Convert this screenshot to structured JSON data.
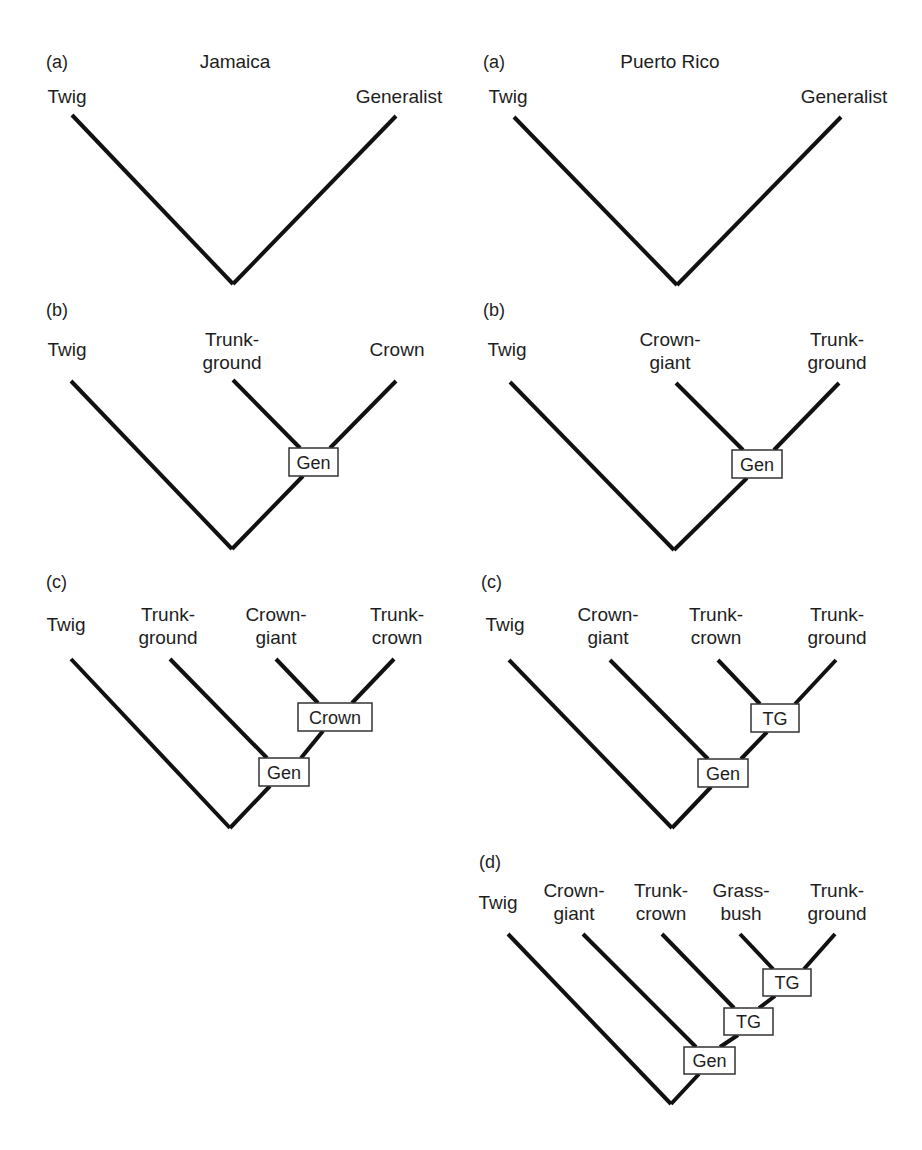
{
  "figure": {
    "columns": [
      {
        "title": "Jamaica",
        "title_pos": [
          235,
          68
        ]
      },
      {
        "title": "Puerto Rico",
        "title_pos": [
          670,
          68
        ]
      }
    ],
    "colors": {
      "line": "#111111",
      "text": "#1e1e1e",
      "box_border": "#333333",
      "background": "#ffffff"
    }
  },
  "trees": [
    {
      "id": "jamaica-a",
      "island": "Jamaica",
      "panel": "(a)",
      "panel_pos": [
        46,
        68
      ],
      "tips": [
        {
          "lines": [
            "Twig"
          ],
          "x": 67,
          "y": 103,
          "anchor": "middle"
        },
        {
          "lines": [
            "Generalist"
          ],
          "x": 399,
          "y": 103,
          "anchor": "middle"
        }
      ],
      "segments": [
        [
          72,
          115,
          233,
          284
        ],
        [
          396,
          116,
          233,
          284
        ]
      ],
      "nodes": []
    },
    {
      "id": "puerto-rico-a",
      "island": "Puerto Rico",
      "panel": "(a)",
      "panel_pos": [
        483,
        68
      ],
      "tips": [
        {
          "lines": [
            "Twig"
          ],
          "x": 508,
          "y": 103,
          "anchor": "middle"
        },
        {
          "lines": [
            "Generalist"
          ],
          "x": 844,
          "y": 103,
          "anchor": "middle"
        }
      ],
      "segments": [
        [
          514,
          117,
          677,
          285
        ],
        [
          841,
          117,
          677,
          285
        ]
      ],
      "nodes": []
    },
    {
      "id": "jamaica-b",
      "island": "Jamaica",
      "panel": "(b)",
      "panel_pos": [
        46,
        316
      ],
      "tips": [
        {
          "lines": [
            "Twig"
          ],
          "x": 67,
          "y": 356,
          "anchor": "middle"
        },
        {
          "lines": [
            "Trunk-",
            "ground"
          ],
          "x": 232,
          "y": 346,
          "anchor": "middle"
        },
        {
          "lines": [
            "Crown"
          ],
          "x": 397,
          "y": 356,
          "anchor": "middle"
        }
      ],
      "segments": [
        [
          71,
          381,
          232,
          549
        ],
        [
          233,
          380,
          300,
          448
        ],
        [
          396,
          381,
          330,
          448
        ],
        [
          303,
          476,
          232,
          549
        ]
      ],
      "nodes": [
        {
          "label": "Gen",
          "x": 289,
          "y": 448,
          "w": 49,
          "h": 28
        }
      ]
    },
    {
      "id": "puerto-rico-b",
      "island": "Puerto Rico",
      "panel": "(b)",
      "panel_pos": [
        483,
        316
      ],
      "tips": [
        {
          "lines": [
            "Twig"
          ],
          "x": 507,
          "y": 356,
          "anchor": "middle"
        },
        {
          "lines": [
            "Crown-",
            "giant"
          ],
          "x": 670,
          "y": 346,
          "anchor": "middle"
        },
        {
          "lines": [
            "Trunk-",
            "ground"
          ],
          "x": 837,
          "y": 346,
          "anchor": "middle"
        }
      ],
      "segments": [
        [
          510,
          382,
          674,
          550
        ],
        [
          676,
          383,
          743,
          450
        ],
        [
          839,
          383,
          774,
          450
        ],
        [
          747,
          478,
          674,
          550
        ]
      ],
      "nodes": [
        {
          "label": "Gen",
          "x": 732,
          "y": 450,
          "w": 50,
          "h": 28
        }
      ]
    },
    {
      "id": "jamaica-c",
      "island": "Jamaica",
      "panel": "(c)",
      "panel_pos": [
        46,
        588
      ],
      "tips": [
        {
          "lines": [
            "Twig"
          ],
          "x": 66,
          "y": 631,
          "anchor": "middle"
        },
        {
          "lines": [
            "Trunk-",
            "ground"
          ],
          "x": 168,
          "y": 621,
          "anchor": "middle"
        },
        {
          "lines": [
            "Crown-",
            "giant"
          ],
          "x": 276,
          "y": 621,
          "anchor": "middle"
        },
        {
          "lines": [
            "Trunk-",
            "crown"
          ],
          "x": 397,
          "y": 621,
          "anchor": "middle"
        }
      ],
      "segments": [
        [
          71,
          659,
          230,
          828
        ],
        [
          170,
          659,
          267,
          758
        ],
        [
          276,
          659,
          318,
          703
        ],
        [
          394,
          659,
          352,
          703
        ],
        [
          323,
          731,
          301,
          758
        ],
        [
          270,
          786,
          230,
          828
        ]
      ],
      "nodes": [
        {
          "label": "Crown",
          "x": 298,
          "y": 703,
          "w": 74,
          "h": 28
        },
        {
          "label": "Gen",
          "x": 259,
          "y": 758,
          "w": 50,
          "h": 28
        }
      ]
    },
    {
      "id": "puerto-rico-c",
      "island": "Puerto Rico",
      "panel": "(c)",
      "panel_pos": [
        481,
        588
      ],
      "tips": [
        {
          "lines": [
            "Twig"
          ],
          "x": 505,
          "y": 631,
          "anchor": "middle"
        },
        {
          "lines": [
            "Crown-",
            "giant"
          ],
          "x": 608,
          "y": 621,
          "anchor": "middle"
        },
        {
          "lines": [
            "Trunk-",
            "crown"
          ],
          "x": 716,
          "y": 621,
          "anchor": "middle"
        },
        {
          "lines": [
            "Trunk-",
            "ground"
          ],
          "x": 837,
          "y": 621,
          "anchor": "middle"
        }
      ],
      "segments": [
        [
          509,
          660,
          672,
          828
        ],
        [
          610,
          660,
          708,
          759
        ],
        [
          718,
          660,
          760,
          704
        ],
        [
          836,
          660,
          795,
          704
        ],
        [
          767,
          732,
          741,
          759
        ],
        [
          711,
          787,
          672,
          828
        ]
      ],
      "nodes": [
        {
          "label": "TG",
          "x": 751,
          "y": 704,
          "w": 48,
          "h": 28
        },
        {
          "label": "Gen",
          "x": 698,
          "y": 759,
          "w": 50,
          "h": 28
        }
      ]
    },
    {
      "id": "puerto-rico-d",
      "island": "Puerto Rico",
      "panel": "(d)",
      "panel_pos": [
        479,
        868
      ],
      "tips": [
        {
          "lines": [
            "Twig"
          ],
          "x": 498,
          "y": 909,
          "anchor": "middle"
        },
        {
          "lines": [
            "Crown-",
            "giant"
          ],
          "x": 574,
          "y": 897,
          "anchor": "middle"
        },
        {
          "lines": [
            "Trunk-",
            "crown"
          ],
          "x": 661,
          "y": 897,
          "anchor": "middle"
        },
        {
          "lines": [
            "Grass-",
            "bush"
          ],
          "x": 741,
          "y": 897,
          "anchor": "middle"
        },
        {
          "lines": [
            "Trunk-",
            "ground"
          ],
          "x": 837,
          "y": 897,
          "anchor": "middle"
        }
      ],
      "segments": [
        [
          508,
          934,
          671,
          1104
        ],
        [
          583,
          934,
          696,
          1047
        ],
        [
          662,
          934,
          734,
          1008
        ],
        [
          740,
          934,
          773,
          969
        ],
        [
          835,
          934,
          804,
          969
        ],
        [
          775,
          996,
          759,
          1008
        ],
        [
          738,
          1035,
          720,
          1047
        ],
        [
          699,
          1074,
          671,
          1104
        ]
      ],
      "nodes": [
        {
          "label": "TG",
          "x": 763,
          "y": 969,
          "w": 48,
          "h": 27
        },
        {
          "label": "TG",
          "x": 724,
          "y": 1008,
          "w": 49,
          "h": 27
        },
        {
          "label": "Gen",
          "x": 684,
          "y": 1047,
          "w": 51,
          "h": 27
        }
      ]
    }
  ]
}
